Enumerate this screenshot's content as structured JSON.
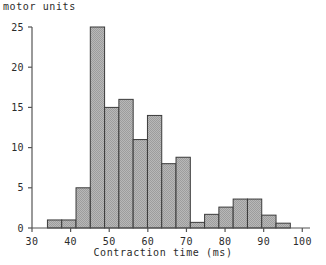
{
  "chart_data": {
    "type": "bar",
    "title": "",
    "xlabel": "Contraction time (ms)",
    "ylabel": "motor units",
    "grid": false,
    "legend": null,
    "xlim": [
      30,
      102
    ],
    "ylim": [
      0,
      25
    ],
    "xticks": [
      30,
      40,
      50,
      60,
      70,
      80,
      90,
      100
    ],
    "yticks": [
      0,
      5,
      10,
      15,
      20,
      25
    ],
    "bin_width": 3.7,
    "bin_edges": [
      34.0,
      37.7,
      41.4,
      45.1,
      48.8,
      52.5,
      56.2,
      59.9,
      63.6,
      67.3,
      71.0,
      74.7,
      78.4,
      82.1,
      85.8,
      89.5,
      93.2,
      96.9,
      100.6
    ],
    "categories": [
      "34-37.7",
      "37.7-41.4",
      "41.4-45.1",
      "45.1-48.8",
      "48.8-52.5",
      "52.5-56.2",
      "56.2-59.9",
      "59.9-63.6",
      "63.6-67.3",
      "67.3-71",
      "71-74.7",
      "74.7-78.4",
      "78.4-82.1",
      "82.1-85.8",
      "85.8-89.5",
      "89.5-93.2",
      "93.2-96.9",
      "96.9-100.6"
    ],
    "values": [
      1,
      1,
      5,
      25,
      15,
      16,
      11,
      14,
      8,
      8.8,
      0.7,
      1.7,
      2.6,
      3.6,
      3.6,
      1.6,
      0.6,
      0
    ],
    "bar_fill": "#b0b0b0",
    "bar_edge": "#3a3a3a",
    "axis_color": "#555555",
    "text_color": "#2b2b2b"
  },
  "axes": {
    "y_tick_labels": [
      "0",
      "5",
      "10",
      "15",
      "20",
      "25"
    ],
    "x_tick_labels": [
      "30",
      "40",
      "50",
      "60",
      "70",
      "80",
      "90",
      "100"
    ]
  }
}
